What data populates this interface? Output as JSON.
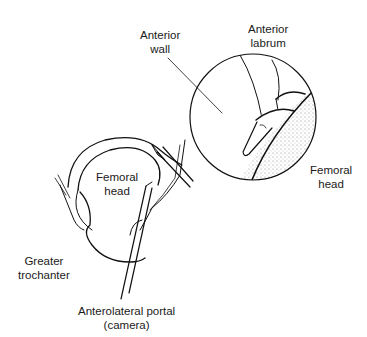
{
  "diagram": {
    "labels": {
      "anterior_wall": [
        "Anterior",
        "wall"
      ],
      "anterior_labrum": [
        "Anterior",
        "labrum"
      ],
      "femoral_head_inset": [
        "Femoral",
        "head"
      ],
      "femoral_head_main": [
        "Femoral",
        "head"
      ],
      "greater_trochanter": [
        "Greater",
        "trochanter"
      ],
      "anterolateral_portal": [
        "Anterolateral portal",
        "(camera)"
      ]
    },
    "inset_view": "circular arthroscopic view",
    "colors": {
      "ink": "#111111",
      "background": "#ffffff"
    }
  }
}
